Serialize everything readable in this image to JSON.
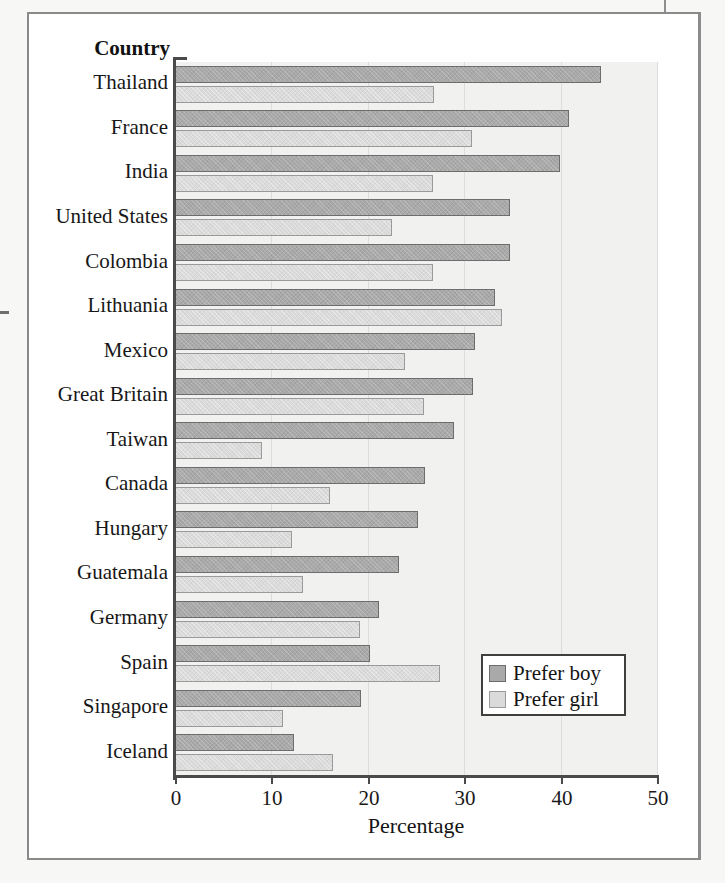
{
  "figure": {
    "y_axis_title": "Country",
    "x_axis_title": "Percentage"
  },
  "legend": {
    "items": [
      {
        "label": "Prefer boy",
        "color": "#a9a9a9",
        "swatch": "boy-swatch"
      },
      {
        "label": "Prefer girl",
        "color": "#d8d8d8",
        "swatch": "girl-swatch"
      }
    ]
  },
  "axis": {
    "x_ticks": [
      "0",
      "10",
      "20",
      "30",
      "40",
      "50"
    ],
    "x_tick_values": [
      0,
      10,
      20,
      30,
      40,
      50
    ],
    "x_min": 0,
    "x_max": 50
  },
  "chart_data": {
    "type": "bar",
    "orientation": "horizontal",
    "title": "",
    "xlabel": "Percentage",
    "ylabel": "Country",
    "xlim": [
      0,
      50
    ],
    "grid": true,
    "legend_position": "inside-lower-right",
    "categories": [
      "Thailand",
      "France",
      "India",
      "United States",
      "Colombia",
      "Lithuania",
      "Mexico",
      "Great Britain",
      "Taiwan",
      "Canada",
      "Hungary",
      "Guatemala",
      "Germany",
      "Spain",
      "Singapore",
      "Iceland"
    ],
    "series": [
      {
        "name": "Prefer boy",
        "color": "#a9a9a9",
        "values": [
          44.2,
          40.9,
          39.9,
          34.7,
          34.8,
          33.2,
          31.1,
          30.9,
          28.9,
          25.9,
          25.2,
          23.2,
          21.2,
          20.2,
          19.3,
          12.3
        ]
      },
      {
        "name": "Prefer girl",
        "color": "#d8d8d8",
        "values": [
          26.9,
          30.8,
          26.8,
          22.5,
          26.8,
          33.9,
          23.9,
          25.8,
          9.0,
          16.1,
          12.1,
          13.3,
          19.2,
          27.5,
          11.2,
          16.4
        ]
      }
    ]
  }
}
